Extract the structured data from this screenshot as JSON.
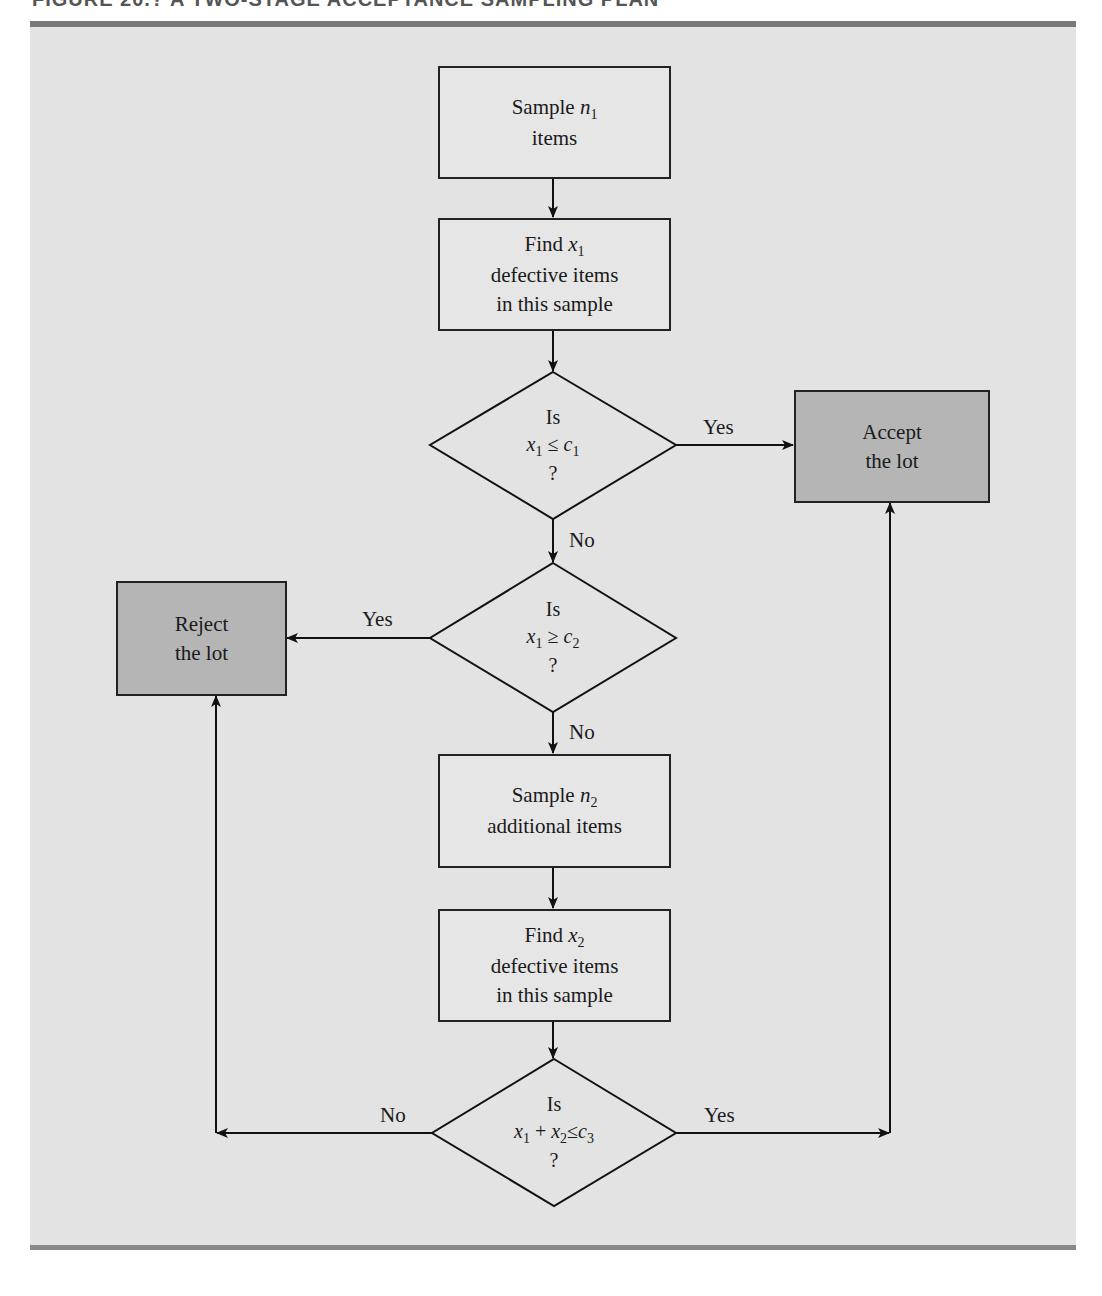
{
  "figure": {
    "title": "FIGURE 20.? A TWO-STAGE ACCEPTANCE SAMPLING PLAN"
  },
  "colors": {
    "panel_background": "#e3e3e3",
    "rule": "#7a7a7a",
    "process_fill": "#e6e6e6",
    "terminal_fill": "#b5b5b5",
    "stroke": "#222222"
  },
  "nodes": {
    "sample_n1": {
      "line1": "Sample",
      "var": "n",
      "sub": "1",
      "line2": "items"
    },
    "find_x1": {
      "line1": "Find",
      "var": "x",
      "sub": "1",
      "line2": "defective items",
      "line3": "in this sample"
    },
    "decision_1": {
      "line1": "Is",
      "expr": {
        "a": "x",
        "a_sub": "1",
        "op": "≤",
        "b": "c",
        "b_sub": "1"
      },
      "line3": "?"
    },
    "decision_2": {
      "line1": "Is",
      "expr": {
        "a": "x",
        "a_sub": "1",
        "op": "≥",
        "b": "c",
        "b_sub": "2"
      },
      "line3": "?"
    },
    "sample_n2": {
      "line1": "Sample",
      "var": "n",
      "sub": "2",
      "line2": "additional items"
    },
    "find_x2": {
      "line1": "Find",
      "var": "x",
      "sub": "2",
      "line2": "defective items",
      "line3": "in this sample"
    },
    "decision_3": {
      "line1": "Is",
      "expr": {
        "a": "x",
        "a_sub": "1",
        "plus": "+",
        "c": "x",
        "c_sub": "2",
        "op": "≤",
        "b": "c",
        "b_sub": "3"
      },
      "line3": "?"
    },
    "accept": {
      "line1": "Accept",
      "line2": "the lot"
    },
    "reject": {
      "line1": "Reject",
      "line2": "the lot"
    }
  },
  "edges": {
    "d1_yes": "Yes",
    "d1_no": "No",
    "d2_yes": "Yes",
    "d2_no": "No",
    "d3_no": "No",
    "d3_yes": "Yes"
  }
}
